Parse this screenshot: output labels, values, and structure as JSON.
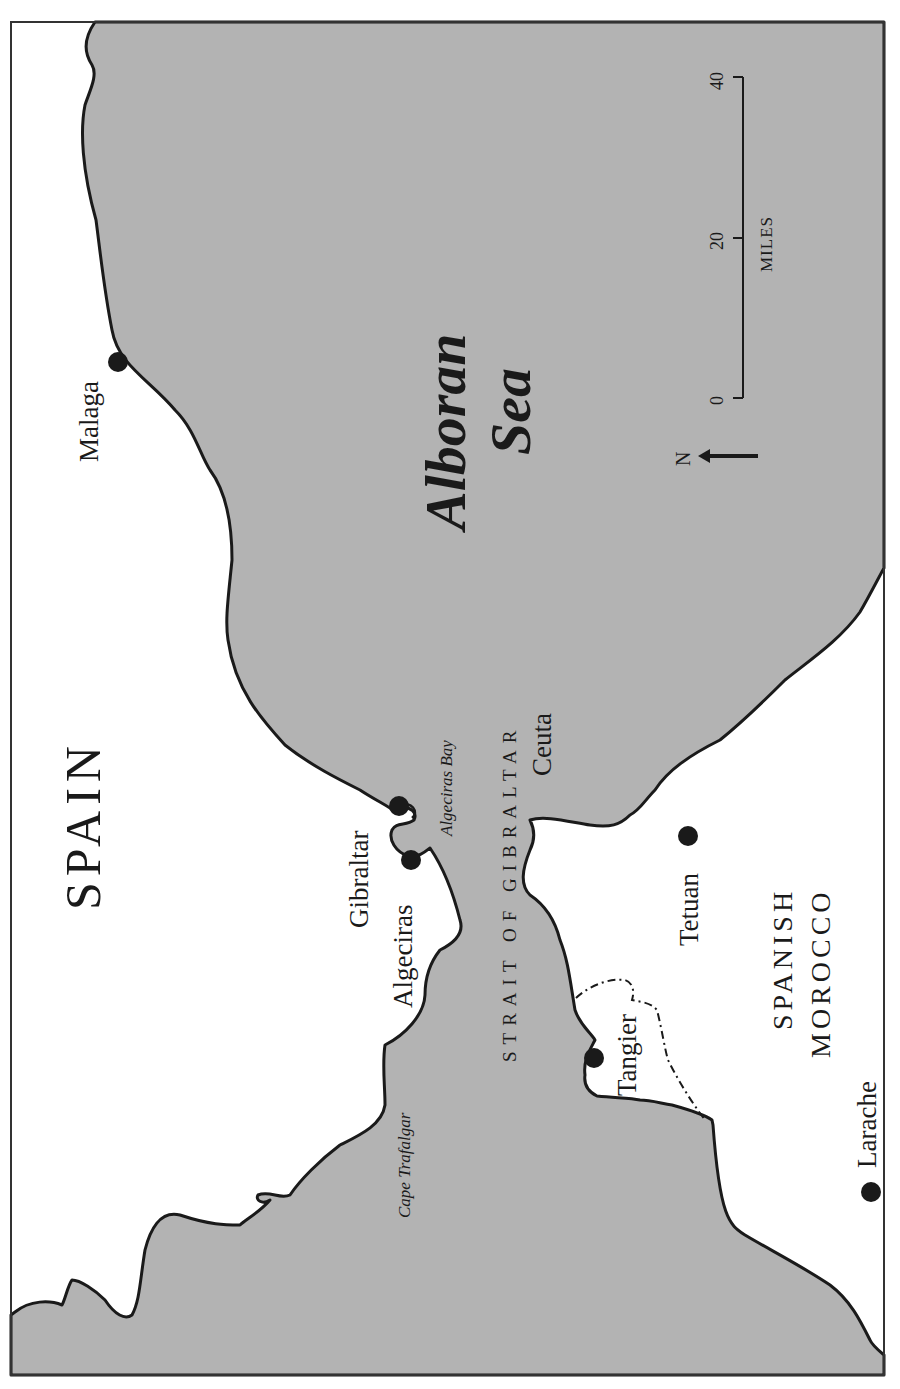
{
  "map": {
    "colors": {
      "sea": "#b3b3b3",
      "land": "#ffffff",
      "coast": "#1a1a1a",
      "frame": "#333333"
    },
    "countries": {
      "spain": "SPAIN",
      "morocco_line1": "SPANISH",
      "morocco_line2": "MOROCCO"
    },
    "water": {
      "sea_line1": "Alboran",
      "sea_line2": "Sea",
      "strait": "STRAIT OF GIBRALTAR",
      "bay": "Algeciras Bay",
      "cape": "Cape Trafalgar"
    },
    "cities": [
      {
        "name": "Malaga"
      },
      {
        "name": "Gibraltar"
      },
      {
        "name": "Algeciras"
      },
      {
        "name": "Ceuta"
      },
      {
        "name": "Tetuan"
      },
      {
        "name": "Tangier"
      },
      {
        "name": "Larache"
      }
    ],
    "scale_bar": {
      "unit": "MILES",
      "ticks": [
        "0",
        "20",
        "40"
      ]
    },
    "north_arrow": {
      "label": "N"
    }
  }
}
